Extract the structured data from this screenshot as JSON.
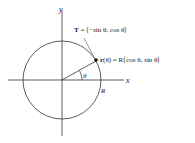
{
  "axes": {
    "x_label": "x",
    "y_label": "y"
  },
  "labels": {
    "tangent_bold": "T",
    "tangent_rest": " = ⟨−sin θ, cos θ⟩",
    "position_bold": "r",
    "position_rest": "(θ) = R⟨cos θ, sin θ⟩",
    "angle": "θ",
    "radius": "R"
  },
  "colors": {
    "stroke": "#222222",
    "tangent": "#888888"
  }
}
